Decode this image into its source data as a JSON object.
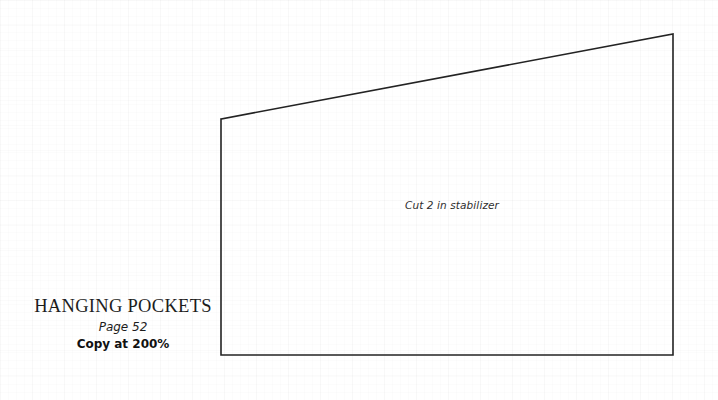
{
  "document": {
    "type": "sewing-pattern-piece-sheet",
    "background": {
      "color": "#ffffff",
      "grid": "faint-graph-paper",
      "grid_color": "#fcfcfc"
    }
  },
  "pattern_piece": {
    "label": "Cut 2 in stabilizer",
    "outline_color": "#232323",
    "outline_width_px": 1.6,
    "fill": "none",
    "shape": "quadrilateral",
    "vertices": [
      {
        "name": "top-left",
        "x": 221,
        "y": 119
      },
      {
        "name": "top-right",
        "x": 673,
        "y": 34
      },
      {
        "name": "bottom-right",
        "x": 673,
        "y": 355
      },
      {
        "name": "bottom-left",
        "x": 221,
        "y": 355
      }
    ],
    "points_attr": "221,119 673,34 673,355 221,355 221,119"
  },
  "title_block": {
    "title": "HANGING POCKETS",
    "page": "Page 52",
    "copy_scale": "Copy at 200%"
  }
}
